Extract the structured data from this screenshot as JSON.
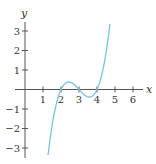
{
  "chart_data": {
    "type": "line",
    "title": "",
    "xlabel": "x",
    "ylabel": "y",
    "xlim": [
      0,
      6.5
    ],
    "ylim": [
      -3.4,
      3.4
    ],
    "x_ticks": [
      1,
      2,
      3,
      4,
      5,
      6
    ],
    "y_ticks": [
      -3,
      -2,
      -1,
      1,
      2,
      3
    ],
    "x_tick_labels": [
      "1",
      "2",
      "3",
      "4",
      "5",
      "6"
    ],
    "y_tick_labels": [
      "−3",
      "−2",
      "−1",
      "1",
      "2",
      "3"
    ],
    "grid": false,
    "legend": null,
    "series": [
      {
        "name": "y = (x−2)(x−3)(x−4)",
        "color": "#7cc3dc",
        "x_range": [
          1.28,
          4.72
        ],
        "roots": [
          2,
          3,
          4
        ],
        "x": [
          1.3,
          1.5,
          1.75,
          2.0,
          2.25,
          2.42,
          2.6,
          2.8,
          3.0,
          3.2,
          3.4,
          3.58,
          3.75,
          4.0,
          4.25,
          4.5,
          4.72
        ],
        "y": [
          -3.21,
          -1.88,
          -0.7,
          0.0,
          0.33,
          0.38,
          0.34,
          0.19,
          0.0,
          -0.19,
          -0.34,
          -0.38,
          -0.33,
          0.0,
          0.7,
          1.88,
          3.52
        ]
      }
    ]
  },
  "axes": {
    "x_title": "x",
    "y_title": "y"
  }
}
